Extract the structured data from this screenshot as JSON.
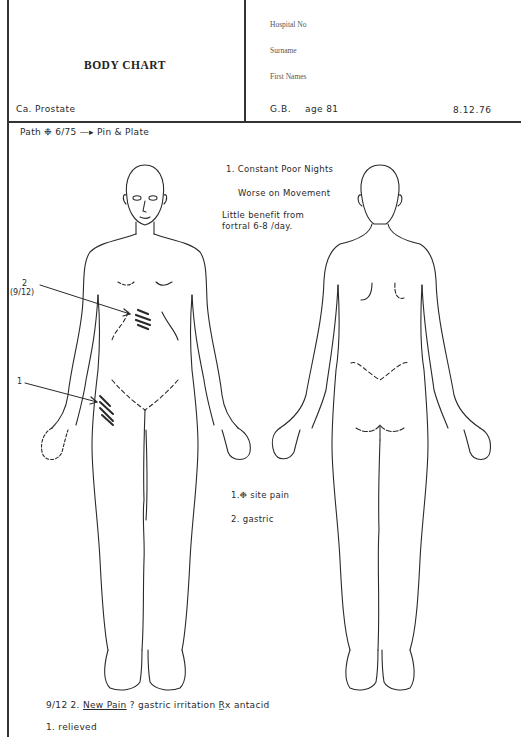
{
  "header": {
    "title": "BODY CHART",
    "diagnosis": "Ca. Prostate",
    "fields": {
      "hospital_no_label": "Hospital No",
      "surname_label": "Surname",
      "first_names_label": "First Names"
    },
    "patient_initials": "G.B.",
    "age": "age 81",
    "date": "8.12.76"
  },
  "history": {
    "path_label": "Path",
    "path_symbol": "❉",
    "path_date": "6/75",
    "arrow": "—▸",
    "procedure": "Pin & Plate"
  },
  "notes": {
    "line1": "1. Constant Poor Nights",
    "line2": "Worse on Movement",
    "line3": "Little  benefit from",
    "line4": "fortral 6-8 /day."
  },
  "markers": {
    "marker2_number": "2",
    "marker2_date": "(9/12)",
    "marker1_number": "1"
  },
  "legend": {
    "item1_prefix": "1.",
    "item1_symbol": "❉",
    "item1_text": "site pain",
    "item2": "2.  gastric"
  },
  "followup": {
    "date": "9/12",
    "item": "2.",
    "new_pain": "New Pain",
    "rest": "?  gastric irritation",
    "rx_symbol": "R̲x",
    "treatment": "antacid",
    "line2": "1.  relieved"
  },
  "figures": {
    "front": "anterior-body-outline",
    "back": "posterior-body-outline"
  }
}
